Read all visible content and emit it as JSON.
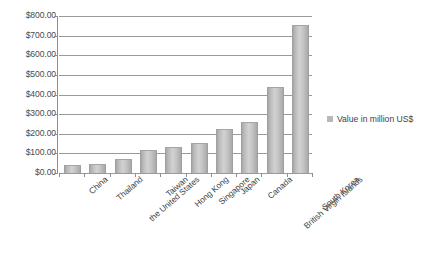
{
  "chart_data": {
    "type": "bar",
    "title": "",
    "subtitle": "",
    "xlabel": "",
    "ylabel": "",
    "ylim": [
      0,
      800
    ],
    "ytick_step": 100,
    "grid": true,
    "legend_position": "right",
    "categories": [
      "China",
      "Thailand",
      "the United States",
      "Taiwan",
      "Hong Kong",
      "Singapore",
      "Japan",
      "Canada",
      "British Virgin Islands",
      "South Korea"
    ],
    "values": [
      35,
      42,
      65,
      110,
      125,
      150,
      220,
      255,
      435,
      750
    ],
    "series": [
      {
        "name": "Value in million US$",
        "values": [
          35,
          42,
          65,
          110,
          125,
          150,
          220,
          255,
          435,
          750
        ]
      }
    ],
    "ytick_labels": [
      "$800.00",
      "$700.00",
      "$600.00",
      "$500.00",
      "$400.00",
      "$300.00",
      "$200.00",
      "$100.00",
      "$0.00"
    ],
    "ytick_values": [
      800,
      700,
      600,
      500,
      400,
      300,
      200,
      100,
      0
    ],
    "legend": [
      "Value in million US$"
    ],
    "bar_color": "#c0c0c0",
    "gridline_color": "#9a9a9a",
    "axis_color": "#8f8f8f",
    "background_color": "#ffffff"
  },
  "legend": {
    "label": "Value in million US$",
    "swatch_color": "#b9b9b9"
  }
}
